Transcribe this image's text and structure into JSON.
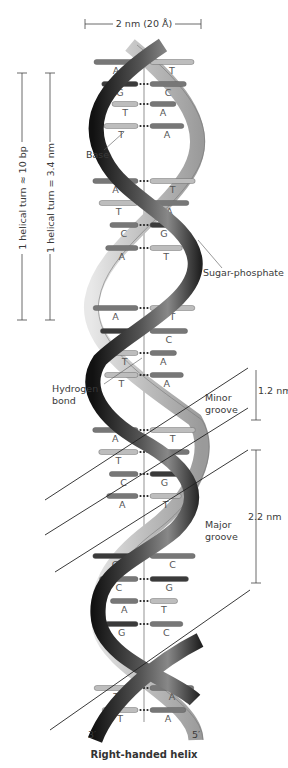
{
  "diagram": {
    "title": "Right-handed helix",
    "width_label": "2 nm (20 Å)",
    "turn_bp_label": "1 helical turn ≈ 10 bp",
    "turn_nm_label": "1 helical turn = 3.4 nm",
    "labels": {
      "base": "Base",
      "sugar_phosphate": "Sugar-phosphate",
      "hydrogen_bond_1": "Hydrogen",
      "hydrogen_bond_2": "bond",
      "minor_groove_1": "Minor",
      "minor_groove_2": "groove",
      "minor_groove_width": "1.2 nm",
      "major_groove_1": "Major",
      "major_groove_2": "groove",
      "major_groove_width": "2.2 nm",
      "end_left": "3′",
      "end_right": "5′"
    },
    "base_pairs": [
      {
        "left": "A",
        "right": "T",
        "y": 62
      },
      {
        "left": "G",
        "right": "C",
        "y": 84
      },
      {
        "left": "T",
        "right": "A",
        "y": 104
      },
      {
        "left": "T",
        "right": "A",
        "y": 126
      },
      {
        "left": "A",
        "right": "T",
        "y": 181
      },
      {
        "left": "T",
        "right": "A",
        "y": 203
      },
      {
        "left": "C",
        "right": "G",
        "y": 225
      },
      {
        "left": "A",
        "right": "T",
        "y": 248
      },
      {
        "left": "A",
        "right": "T",
        "y": 308
      },
      {
        "left": "G",
        "right": "C",
        "y": 331
      },
      {
        "left": "T",
        "right": "A",
        "y": 353
      },
      {
        "left": "T",
        "right": "A",
        "y": 375
      },
      {
        "left": "A",
        "right": "T",
        "y": 430
      },
      {
        "left": "T",
        "right": "A",
        "y": 452
      },
      {
        "left": "C",
        "right": "G",
        "y": 474
      },
      {
        "left": "A",
        "right": "T",
        "y": 496
      },
      {
        "left": "G",
        "right": "C",
        "y": 556
      },
      {
        "left": "C",
        "right": "G",
        "y": 579
      },
      {
        "left": "A",
        "right": "T",
        "y": 601
      },
      {
        "left": "G",
        "right": "C",
        "y": 624
      },
      {
        "left": "T",
        "right": "A",
        "y": 688
      },
      {
        "left": "T",
        "right": "A",
        "y": 710
      }
    ],
    "colors": {
      "dark_strand": "#2a2a2a",
      "light_strand": "#c8c8c8",
      "base_dark": "#3a3a3a",
      "base_mid": "#777777",
      "base_light": "#bdbdbd",
      "line": "#333333"
    }
  }
}
